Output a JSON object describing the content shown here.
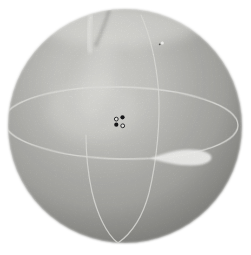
{
  "figure": {
    "kind": "photograph-of-globe-model",
    "background": "#ffffff",
    "sphere": {
      "cx": 125,
      "cy": 126,
      "r": 117,
      "highlight": "#dcdcd8",
      "light": "#cfcfcb",
      "mid": "#b8b8b4",
      "shade": "#a6a6a2",
      "edge": "#9a9a96",
      "edge_dark": "rgba(60,60,56,0.22)"
    },
    "equator_line": {
      "cx": 121,
      "cy": 123,
      "rx": 117,
      "ry": 36,
      "transform": "rotate(1.2 121 123)",
      "stroke": "#eeeeea",
      "width": 1.3
    },
    "meridian_line": {
      "d": "M141,15 C149,33 156,60 158.5,90 C160.5,120 157,160 149,193 C144,212 135,231 118,243 C106,234 97,213 92,192 C88,174 86,152 86,135",
      "stroke": "#e9e9e5",
      "width": 1.2
    },
    "bright_patch": {
      "d": "M150,158.5 C166,153 176,149.5 189,149.5 C201,149.5 211.5,153 211.5,157.5 C211.5,162 203,165.5 191,165.5 C177,165.5 163,162 150,158.5 Z",
      "fill": "#fbfbf9",
      "opacity": 0.95
    },
    "polar_smudge": {
      "dark_d": "M109,11 C106,21 102,31 96,45",
      "dark_stroke": "rgba(92,92,88,0.26)",
      "bright_d": "M91,16 C89,27 88,39 90,51",
      "bright_stroke": "rgba(250,250,246,0.55)"
    },
    "spot_markers": {
      "dot_fill": "#17171a",
      "ring_stroke": "#2b2b2e",
      "ring_fill": "#f3f3ef",
      "open": [
        {
          "cx": 116.3,
          "cy": 119.1,
          "r": 1.9
        },
        {
          "cx": 122.7,
          "cy": 125.8,
          "r": 1.9
        }
      ],
      "filled": [
        {
          "cx": 122.5,
          "cy": 117.3,
          "r": 2.1
        },
        {
          "cx": 116.3,
          "cy": 124.7,
          "r": 2.1
        }
      ]
    },
    "speck": {
      "cx": 162.3,
      "cy": 43,
      "r": 1.6,
      "fill": "#fcfcfa",
      "dark_cx": 159.7,
      "dark_cy": 44.3,
      "dark_r": 0.9,
      "dark_fill": "rgba(64,64,60,0.8)"
    }
  }
}
